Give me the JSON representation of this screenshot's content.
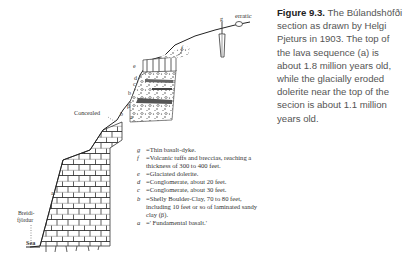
{
  "caption": {
    "figure_number": "Figure 9.3.",
    "text": "The Búlandshöfði section as drawn by Helgi Pjeturs in 1903. The top of the lava sequence (a) is about 1.8 million years old, while the glacially eroded dolerite near the top of the secion is about 1.1 million years old."
  },
  "drawing": {
    "labels": {
      "erratic": "erratic",
      "g": "g",
      "f": "f",
      "e": "e",
      "d": "d",
      "c": "c",
      "b_upper": "b",
      "beta": "β",
      "b_lower": "b",
      "a_upper": "a",
      "concealed": "Concealed",
      "a": "a.",
      "breidi": "Breidi-",
      "fjordur": "fjördur",
      "sea": "Sea"
    },
    "legend": [
      {
        "key": "g",
        "text": "=Thin basalt-dyke."
      },
      {
        "key": "f",
        "text": "=Volcanic tuffs and breccias, reaching a thickness of 300 to 400 feet."
      },
      {
        "key": "e",
        "text": "=Glaciated dolerite."
      },
      {
        "key": "d",
        "text": "=Conglomerate, about 20 feet."
      },
      {
        "key": "c",
        "text": "=Conglomerate, about 30 feet."
      },
      {
        "key": "b",
        "text": "=Shelly Boulder-Clay, 70 to 80 feet, including 10 feet or so of laminated sandy clay (β)."
      },
      {
        "key": "a",
        "text": "=' Fundamental basalt.'"
      }
    ]
  }
}
